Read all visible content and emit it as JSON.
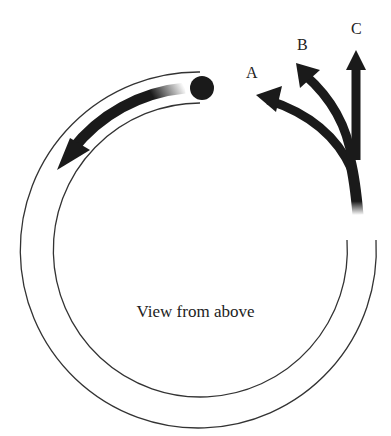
{
  "diagram": {
    "caption": "View from above",
    "path_labels": [
      "A",
      "B",
      "C"
    ],
    "elements": {
      "track": "circular tube, open near top-right",
      "ball": "exits tube at top",
      "motion_arrow": "curved arrow inside tube showing direction"
    },
    "colors": {
      "ink": "#1a1a1a",
      "background": "#ffffff"
    }
  }
}
